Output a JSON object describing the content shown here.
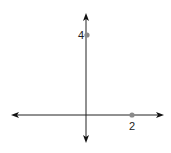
{
  "diagram": {
    "type": "coordinate-axes",
    "axes": {
      "color": "#222222",
      "x_axis": {
        "arrows": "both"
      },
      "y_axis": {
        "arrows": "both"
      }
    },
    "points": [
      {
        "label": "4",
        "axis": "y",
        "value": 4,
        "color": "#8a8a8a"
      },
      {
        "label": "2",
        "axis": "x",
        "value": 2,
        "color": "#8a8a8a"
      }
    ]
  }
}
